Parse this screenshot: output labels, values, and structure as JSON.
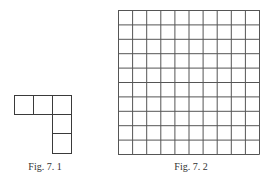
{
  "figures": [
    {
      "id": "fig-7-1",
      "caption": "Fig. 7. 1",
      "shape": "L-shaped arrangement of 5 unit squares: 3 in a row, 2 stacked below the rightmost",
      "cells": [
        [
          0,
          0
        ],
        [
          1,
          0
        ],
        [
          2,
          0
        ],
        [
          2,
          1
        ],
        [
          2,
          2
        ]
      ]
    },
    {
      "id": "fig-7-2",
      "caption": "Fig. 7. 2",
      "shape": "square grid",
      "rows": 10,
      "cols": 10
    }
  ],
  "colors": {
    "line": "#3a3a3a",
    "background": "#ffffff",
    "text": "#333333"
  }
}
